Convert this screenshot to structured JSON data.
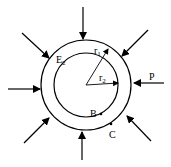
{
  "diagram": {
    "type": "thick-walled cylinder under external pressure",
    "labels": {
      "outer_material": "E",
      "outer_material_sub": "2",
      "outer_radius": "r",
      "outer_radius_sub": "1",
      "inner_radius": "r",
      "inner_radius_sub": "2",
      "pressure": "P",
      "inner_point": "B",
      "outer_point": "C"
    },
    "colors": {
      "stroke": "#000000",
      "background": "#ffffff"
    }
  }
}
